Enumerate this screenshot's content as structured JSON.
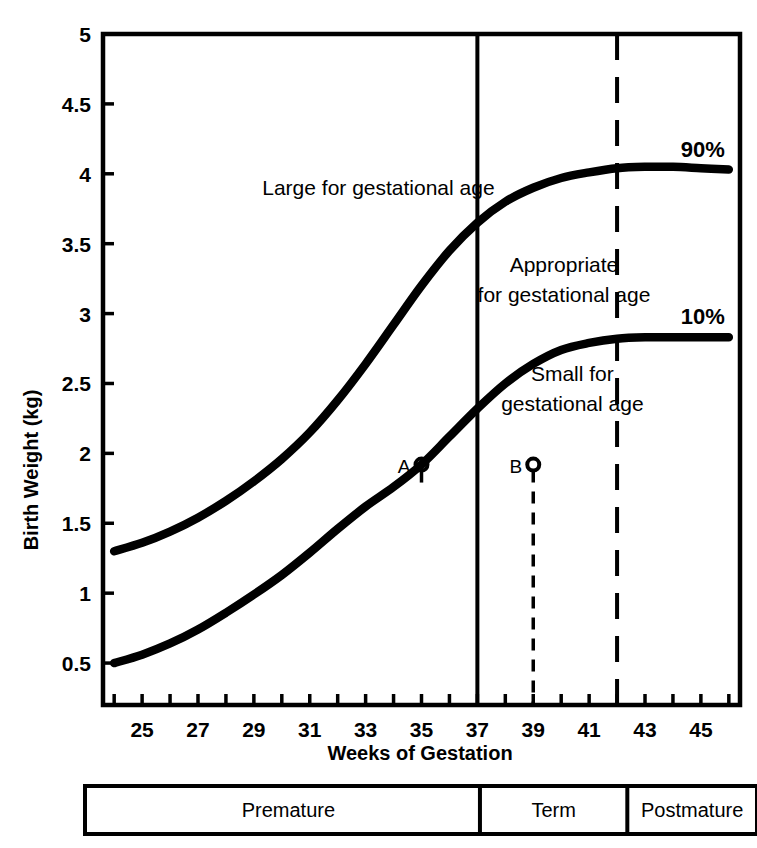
{
  "chart_data": {
    "type": "line",
    "title": "",
    "xlabel": "Weeks of Gestation",
    "ylabel": "Birth Weight (kg)",
    "xlim": [
      23.6,
      46.4
    ],
    "ylim": [
      0.2,
      5.0
    ],
    "grid": false,
    "legend_position": "inline-right",
    "x_tick_labels": [
      "25",
      "27",
      "29",
      "31",
      "33",
      "35",
      "37",
      "39",
      "41",
      "43",
      "45"
    ],
    "x_tick_values": [
      25,
      27,
      29,
      31,
      33,
      35,
      37,
      39,
      41,
      43,
      45
    ],
    "y_tick_labels": [
      "0.5",
      "1",
      "1.5",
      "2",
      "2.5",
      "3",
      "3.5",
      "4",
      "4.5",
      "5"
    ],
    "y_tick_values": [
      0.5,
      1,
      1.5,
      2,
      2.5,
      3,
      3.5,
      4,
      4.5,
      5
    ],
    "series": [
      {
        "name": "90%",
        "label": "90%",
        "x": [
          24,
          25,
          26,
          27,
          28,
          29,
          30,
          31,
          32,
          33,
          34,
          35,
          36,
          37,
          38,
          39,
          40,
          41,
          42,
          43,
          44,
          45,
          46
        ],
        "values": [
          1.3,
          1.36,
          1.44,
          1.54,
          1.66,
          1.8,
          1.96,
          2.15,
          2.38,
          2.64,
          2.92,
          3.2,
          3.45,
          3.65,
          3.8,
          3.9,
          3.97,
          4.01,
          4.04,
          4.05,
          4.05,
          4.04,
          4.03
        ]
      },
      {
        "name": "10%",
        "label": "10%",
        "x": [
          24,
          25,
          26,
          27,
          28,
          29,
          30,
          31,
          32,
          33,
          34,
          35,
          36,
          37,
          38,
          39,
          40,
          41,
          42,
          43,
          44,
          45,
          46
        ],
        "values": [
          0.5,
          0.56,
          0.64,
          0.74,
          0.86,
          0.99,
          1.13,
          1.29,
          1.46,
          1.62,
          1.76,
          1.92,
          2.12,
          2.32,
          2.5,
          2.64,
          2.74,
          2.79,
          2.82,
          2.83,
          2.83,
          2.83,
          2.83
        ]
      }
    ],
    "region_labels": [
      {
        "id": "large",
        "text": "Large for gestational age",
        "x": 29.3,
        "y": 3.85
      },
      {
        "id": "appropriate-line1",
        "text": "Appropriate",
        "x": 40.1,
        "y": 3.3
      },
      {
        "id": "appropriate-line2",
        "text": "for gestational  age",
        "x": 40.1,
        "y": 3.08
      },
      {
        "id": "small-line1",
        "text": "Small for",
        "x": 40.4,
        "y": 2.52
      },
      {
        "id": "small-line2",
        "text": "gestational age",
        "x": 40.4,
        "y": 2.3
      }
    ],
    "vertical_dividers": [
      {
        "id": "term-start",
        "week": 37,
        "style": "solid"
      },
      {
        "id": "postmature-start",
        "week": 42,
        "style": "dashed"
      }
    ],
    "markers": [
      {
        "id": "A",
        "label": "A",
        "week": 35,
        "weight": 1.92,
        "curve_weight": 1.75,
        "line_style": "dashed"
      },
      {
        "id": "B",
        "label": "B",
        "week": 39,
        "weight": 1.92,
        "curve_weight": 0.2,
        "line_style": "dashed"
      }
    ]
  },
  "classification_bar": {
    "segments": [
      {
        "id": "premature",
        "label": "Premature",
        "start_week": 24,
        "end_week": 37
      },
      {
        "id": "term",
        "label": "Term",
        "start_week": 37,
        "end_week": 42
      },
      {
        "id": "postmature",
        "label": "Postmature",
        "start_week": 42,
        "end_week": 46.4
      }
    ]
  },
  "colors": {
    "ink": "#000000",
    "background": "#ffffff"
  }
}
